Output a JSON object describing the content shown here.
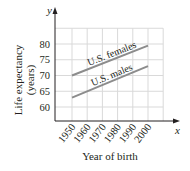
{
  "chart_data": {
    "type": "line",
    "title": "",
    "xlabel": "Year of birth",
    "ylabel": "Life expectancy (years)",
    "ylabel_lines": [
      "Life expectancy",
      "(years)"
    ],
    "x_axis_var": "x",
    "y_axis_var": "y",
    "x_ticks": [
      "1950",
      "1960",
      "1970",
      "1980",
      "1990",
      "2000"
    ],
    "y_ticks": [
      "60",
      "65",
      "70",
      "75",
      "80"
    ],
    "xlim": [
      1945,
      2015
    ],
    "ylim": [
      55,
      85
    ],
    "grid": true,
    "legend": "inline labels on lines",
    "series": [
      {
        "name": "U.S. females",
        "x": [
          1950,
          2000
        ],
        "values": [
          70,
          79.5
        ],
        "color": "#8c8c8c"
      },
      {
        "name": "U.S. males",
        "x": [
          1950,
          2000
        ],
        "values": [
          63,
          73
        ],
        "color": "#8c8c8c"
      }
    ]
  },
  "colors": {
    "axis": "#231f20",
    "grid": "#d9d9d9",
    "line": "#8c8c8c"
  }
}
